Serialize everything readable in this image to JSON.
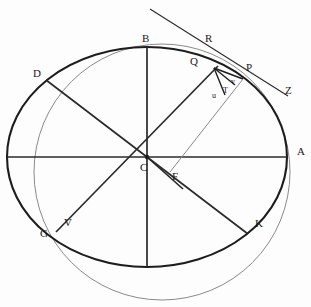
{
  "figure": {
    "title_fragment": "",
    "background_color": "#fdfdfd",
    "stroke_dark": "#1d1d1d",
    "stroke_light": "#8a8a8a",
    "width": 311,
    "height": 307
  },
  "shapes": {
    "ellipse": {
      "name": "main-ellipse",
      "cx": 147,
      "cy": 157,
      "rx": 140,
      "ry": 110,
      "stroke": "#1d1d1d",
      "stroke_width": 2.1
    },
    "circle": {
      "name": "auxiliary-circle",
      "cx": 162,
      "cy": 172,
      "r": 128,
      "stroke": "#8a8a8a",
      "stroke_width": 1.0
    }
  },
  "diameters": [
    {
      "name": "horizontal-diameter",
      "from": [
        7,
        157
      ],
      "to": [
        287,
        157
      ],
      "weight": "thick"
    },
    {
      "name": "vertical-diameter",
      "from": [
        147,
        47
      ],
      "to": [
        147,
        267
      ],
      "weight": "thick"
    },
    {
      "name": "diameter-D-K",
      "from": [
        46,
        80
      ],
      "to": [
        248,
        234
      ],
      "weight": "thick"
    },
    {
      "name": "diameter-G-Q",
      "from": [
        56,
        232
      ],
      "to": [
        218,
        66
      ],
      "weight": "thick"
    }
  ],
  "segments": [
    {
      "name": "tangent-line-R-Q-Z",
      "from": [
        150,
        9
      ],
      "to": [
        288,
        96
      ],
      "weight": "thin"
    },
    {
      "name": "chord-Q-P",
      "from": [
        214,
        68
      ],
      "to": [
        243,
        79
      ],
      "weight": "thick"
    },
    {
      "name": "chord-Q-v",
      "from": [
        214,
        68
      ],
      "to": [
        235,
        84
      ],
      "weight": "thick"
    },
    {
      "name": "chord-Q-T",
      "from": [
        214,
        68
      ],
      "to": [
        224,
        93
      ],
      "weight": "thick"
    },
    {
      "name": "line-F-to-P",
      "from": [
        172,
        170
      ],
      "to": [
        243,
        79
      ],
      "weight": "thin"
    },
    {
      "name": "line-C-to-F",
      "from": [
        147,
        157
      ],
      "to": [
        180,
        186
      ],
      "weight": "thick"
    }
  ],
  "points": [
    {
      "id": "A",
      "label": "A",
      "x": 285,
      "y": 152,
      "size": "cap",
      "lx": 297,
      "ly": 146,
      "desc": "right vertex of ellipse"
    },
    {
      "id": "B",
      "label": "B",
      "x": 147,
      "y": 47,
      "size": "cap",
      "lx": 142,
      "ly": 33,
      "desc": "top vertex of ellipse"
    },
    {
      "id": "C",
      "label": "C",
      "x": 147,
      "y": 157,
      "size": "cap",
      "lx": 140,
      "ly": 162,
      "desc": "centre of ellipse"
    },
    {
      "id": "D",
      "label": "D",
      "x": 46,
      "y": 80,
      "size": "cap",
      "lx": 33,
      "ly": 68,
      "desc": "upper-left point on ellipse"
    },
    {
      "id": "F",
      "label": "F",
      "x": 180,
      "y": 186,
      "size": "cap",
      "lx": 172,
      "ly": 171,
      "desc": "focus-like point below centre"
    },
    {
      "id": "G",
      "label": "G",
      "x": 56,
      "y": 232,
      "size": "cap",
      "lx": 40,
      "ly": 228,
      "desc": "lower-left point on ellipse"
    },
    {
      "id": "K",
      "label": "K",
      "x": 248,
      "y": 234,
      "size": "cap",
      "lx": 255,
      "ly": 218,
      "desc": "lower-right point on ellipse"
    },
    {
      "id": "P",
      "label": "P",
      "x": 243,
      "y": 79,
      "size": "cap",
      "lx": 246,
      "ly": 62,
      "desc": "point on ellipse upper right"
    },
    {
      "id": "Q",
      "label": "Q",
      "x": 214,
      "y": 68,
      "size": "cap",
      "lx": 190,
      "ly": 56,
      "desc": "point on circle upper right"
    },
    {
      "id": "R",
      "label": "R",
      "x": 222,
      "y": 50,
      "size": "cap",
      "lx": 205,
      "ly": 33,
      "desc": "point on tangent line"
    },
    {
      "id": "V",
      "label": "V",
      "x": 62,
      "y": 226,
      "size": "cap",
      "lx": 64,
      "ly": 217,
      "desc": "circle/ellipse crossing lower left"
    },
    {
      "id": "Z",
      "label": "Z",
      "x": 288,
      "y": 96,
      "size": "cap",
      "lx": 285,
      "ly": 85,
      "desc": "end of tangent line at right"
    },
    {
      "id": "u",
      "label": "u",
      "x": 216,
      "y": 96,
      "size": "small",
      "lx": 212,
      "ly": 92,
      "desc": "small auxiliary point"
    },
    {
      "id": "v",
      "label": "v",
      "x": 235,
      "y": 84,
      "size": "small",
      "lx": 231,
      "ly": 78,
      "desc": "small auxiliary point"
    },
    {
      "id": "T",
      "label": "T",
      "x": 226,
      "y": 93,
      "size": "small",
      "lx": 223,
      "ly": 87,
      "desc": "small auxiliary point"
    }
  ]
}
